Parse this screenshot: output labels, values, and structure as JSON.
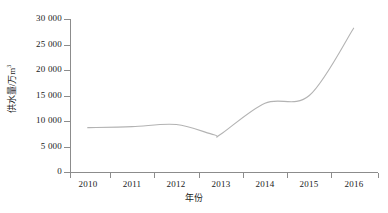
{
  "chart_data": {
    "type": "line",
    "title": "",
    "xlabel": "年份",
    "ylabel": "供水量/万m³",
    "ylabel_base": "供水量/万m",
    "ylabel_sup": "3",
    "x": [
      2010,
      2011,
      2012,
      2013,
      2014,
      2015,
      2016
    ],
    "values": [
      8700,
      8900,
      9300,
      7400,
      13500,
      15000,
      28200
    ],
    "series": [
      {
        "name": "供水量",
        "values": [
          8700,
          8900,
          9300,
          7400,
          13500,
          15000,
          28200
        ],
        "color": "#b3b3b3"
      }
    ],
    "annotations": [
      {
        "label": "最低点",
        "x": 2012.85,
        "y": 7300
      }
    ],
    "xlim": [
      2009.6,
      2016.55
    ],
    "ylim": [
      0,
      30000
    ],
    "xticks": [
      2010,
      2011,
      2012,
      2013,
      2014,
      2015,
      2016
    ],
    "xtick_labels": [
      "2010",
      "2011",
      "2012",
      "2013",
      "2014",
      "2015",
      "2016"
    ],
    "yticks": [
      0,
      5000,
      10000,
      15000,
      20000,
      25000,
      30000
    ],
    "ytick_labels": [
      "0",
      "5 000",
      "10 000",
      "15 000",
      "20 000",
      "25 000",
      "30 000"
    ],
    "grid": false,
    "legend": false,
    "legend_position": "none",
    "markers": false,
    "thousands_separator": " ",
    "axis_color": "#8c8c8c",
    "text_color": "#1a1a1a",
    "background": "#ffffff"
  }
}
